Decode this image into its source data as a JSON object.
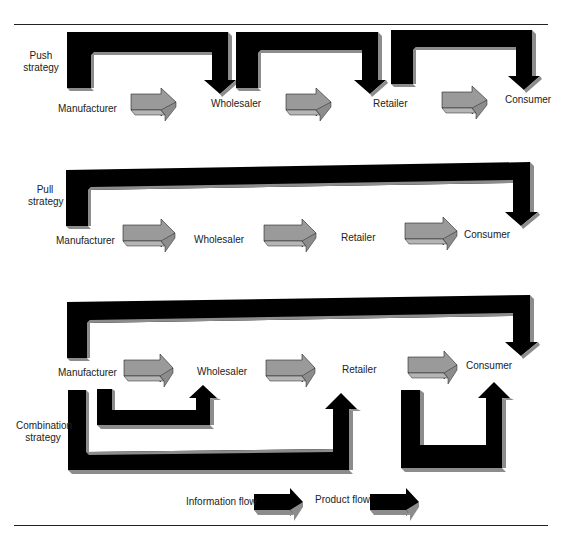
{
  "colors": {
    "info_flow": "#000000",
    "product_flow": "#9a9a9a",
    "bevel": "#8c8c8c",
    "bevel_light": "#b5b5b5",
    "text": "#222222",
    "rule": "#222222"
  },
  "sections": [
    {
      "id": "push",
      "label": "Push\nstrategy",
      "label_lines": [
        "Push",
        "strategy"
      ],
      "nodes": [
        "Manufacturer",
        "Wholesaler",
        "Retailer",
        "Consumer"
      ]
    },
    {
      "id": "pull",
      "label_lines": [
        "Pull",
        "strategy"
      ],
      "nodes": [
        "Manufacturer",
        "Wholesaler",
        "Retailer",
        "Consumer"
      ]
    },
    {
      "id": "combination",
      "label_lines": [
        "Combination",
        "strategy"
      ],
      "nodes": [
        "Manufacturer",
        "Wholesaler",
        "Retailer",
        "Consumer"
      ]
    }
  ],
  "legend": {
    "information_flow": "Information flow",
    "product_flow": "Product flow"
  }
}
